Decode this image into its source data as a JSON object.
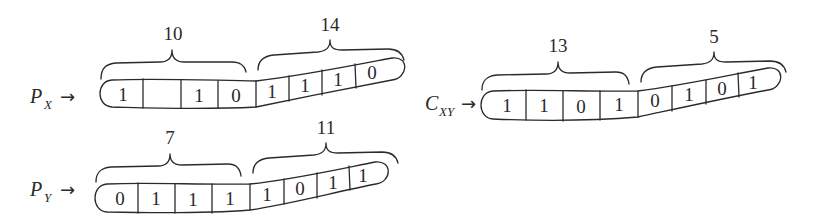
{
  "figure": {
    "strips": [
      {
        "id": "px",
        "pointer": {
          "main": "P",
          "sub": "X",
          "arrow": "→"
        },
        "cells": [
          "1",
          "",
          "1",
          "0",
          "1",
          "1",
          "1",
          "0"
        ],
        "braces": [
          {
            "label": "10"
          },
          {
            "label": "14"
          }
        ]
      },
      {
        "id": "py",
        "pointer": {
          "main": "P",
          "sub": "Y",
          "arrow": "→"
        },
        "cells": [
          "0",
          "1",
          "1",
          "1",
          "1",
          "0",
          "1",
          "1"
        ],
        "braces": [
          {
            "label": "7"
          },
          {
            "label": "11"
          }
        ]
      },
      {
        "id": "cxy",
        "pointer": {
          "main": "C",
          "sub": "XY",
          "arrow": "→"
        },
        "cells": [
          "1",
          "1",
          "0",
          "1",
          "0",
          "1",
          "0",
          "1"
        ],
        "braces": [
          {
            "label": "13"
          },
          {
            "label": "5"
          }
        ]
      }
    ],
    "colors": {
      "ink": "#2a2a2a",
      "background": "#ffffff"
    }
  }
}
